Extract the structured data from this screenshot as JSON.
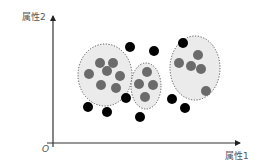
{
  "chart_data": {
    "type": "scatter",
    "title": "",
    "xlabel": "属性1",
    "ylabel": "属性2",
    "origin_label": "O",
    "grid": false,
    "legend": null,
    "clusters": [
      {
        "name": "cluster-1",
        "ellipse": {
          "cx": 105,
          "cy": 75,
          "rx": 27,
          "ry": 31
        },
        "points": [
          [
            100,
            63
          ],
          [
            113,
            63
          ],
          [
            89,
            74
          ],
          [
            107,
            71
          ],
          [
            120,
            76
          ],
          [
            101,
            85
          ],
          [
            116,
            88
          ]
        ]
      },
      {
        "name": "cluster-2",
        "ellipse": {
          "cx": 146,
          "cy": 86,
          "rx": 15,
          "ry": 23
        },
        "points": [
          [
            147,
            72
          ],
          [
            139,
            84
          ],
          [
            153,
            85
          ],
          [
            145,
            97
          ]
        ]
      },
      {
        "name": "cluster-3",
        "ellipse": {
          "cx": 195,
          "cy": 68,
          "rx": 25,
          "ry": 32
        },
        "points": [
          [
            198,
            55
          ],
          [
            179,
            63
          ],
          [
            191,
            66
          ],
          [
            201,
            69
          ],
          [
            206,
            91
          ]
        ]
      }
    ],
    "outliers": [
      [
        130,
        47
      ],
      [
        154,
        51
      ],
      [
        183,
        43
      ],
      [
        88,
        107
      ],
      [
        107,
        112
      ],
      [
        126,
        98
      ],
      [
        140,
        117
      ],
      [
        172,
        99
      ],
      [
        185,
        108
      ]
    ],
    "colors": {
      "cluster_fill": "#ebebeb",
      "cluster_border": "#555555",
      "cluster_point": "#6b6b6b",
      "outlier_point": "#000000",
      "axis": "#333333",
      "label": "#555555"
    }
  },
  "labels": {
    "y_axis": "属性2",
    "x_axis": "属性1",
    "origin": "O"
  }
}
